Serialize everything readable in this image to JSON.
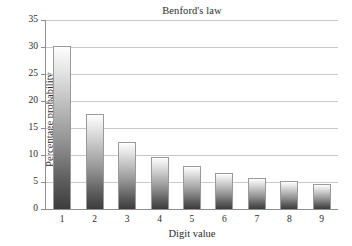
{
  "chart_data": {
    "type": "bar",
    "title": "Benford's law",
    "xlabel": "Digit value",
    "ylabel": "Percentage probability",
    "categories": [
      "1",
      "2",
      "3",
      "4",
      "5",
      "6",
      "7",
      "8",
      "9"
    ],
    "values": [
      30.1,
      17.6,
      12.5,
      9.7,
      7.9,
      6.7,
      5.8,
      5.1,
      4.6
    ],
    "ylim": [
      0,
      35
    ],
    "yticks": [
      0,
      5,
      10,
      15,
      20,
      25,
      30,
      35
    ],
    "ytick_labels": [
      "0",
      "5",
      "10",
      "15",
      "20",
      "25",
      "30",
      "35"
    ],
    "xtick_labels": [
      "1",
      "2",
      "3",
      "4",
      "5",
      "6",
      "7",
      "8",
      "9"
    ],
    "grid": "horizontal",
    "legend": "none",
    "bar_fill_top_color": "#fdfdfd",
    "bar_fill_bottom_color": "#3c3c3c",
    "bar_edge_color": "#9a9a9a",
    "gridline_color": "#c9c9c9",
    "axis_color": "#8e8e8e",
    "background_color": "#ffffff",
    "text_color": "#2b2b2b"
  }
}
